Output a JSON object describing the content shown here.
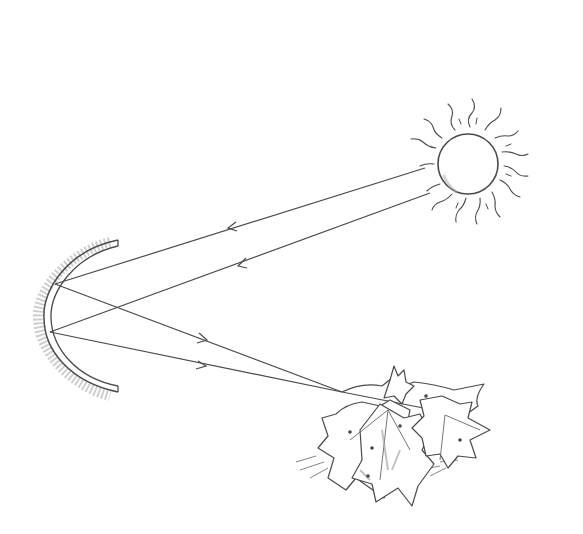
{
  "diagram": {
    "elements": [
      {
        "id": "sun",
        "label": "sun",
        "center": [
          468,
          164
        ],
        "radius": 30
      },
      {
        "id": "mirror",
        "label": "concave mirror",
        "shape": "arc"
      },
      {
        "id": "leaves",
        "label": "pile of leaves",
        "position": [
          395,
          430
        ]
      }
    ],
    "rays": [
      {
        "from": [
          425,
          168
        ],
        "to": [
          55,
          284
        ],
        "direction": "sun-to-mirror"
      },
      {
        "from": [
          430,
          193
        ],
        "to": [
          50,
          332
        ],
        "direction": "sun-to-mirror"
      },
      {
        "from": [
          55,
          284
        ],
        "to": [
          342,
          392
        ],
        "direction": "mirror-to-leaves"
      },
      {
        "from": [
          50,
          332
        ],
        "to": [
          342,
          392
        ],
        "direction": "mirror-to-leaves"
      }
    ]
  },
  "colors": {
    "ink": "#4a4a4a",
    "shade": "#bdbdbd",
    "background": "#ffffff"
  }
}
